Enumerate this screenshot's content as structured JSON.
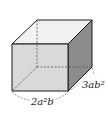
{
  "diagram": {
    "type": "cuboid",
    "labels": {
      "front_bottom_edge": "2a²b",
      "right_bottom_edge": "3ab²"
    },
    "colors": {
      "front_face": "#d9d9d9",
      "top_face": "#f2f2f2",
      "right_face": "#8c8c8c",
      "edge": "#1a1a1a",
      "dashed": "#555555"
    }
  }
}
